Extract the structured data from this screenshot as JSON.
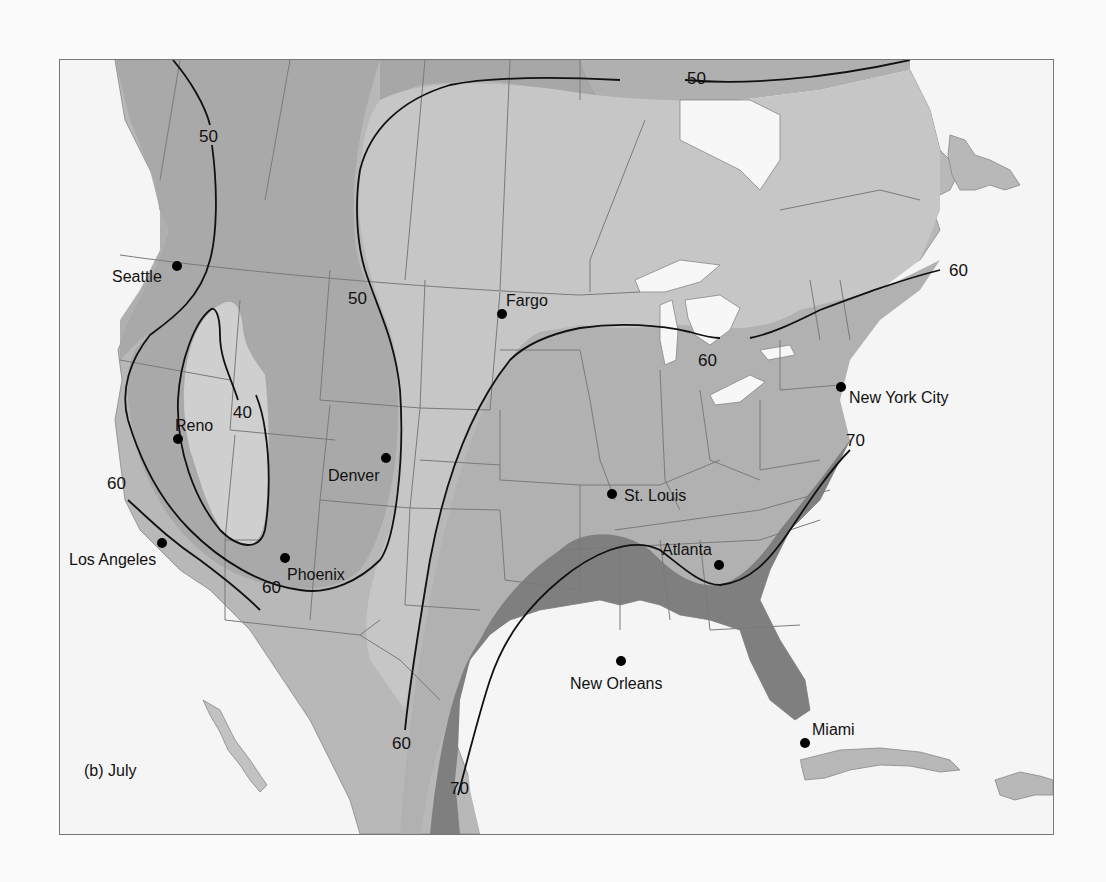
{
  "panel_label": "(b) July",
  "colors": {
    "ocean": "#f5f5f5",
    "lake": "#f7f7f7",
    "band_lt40": "#cdcdcd",
    "band_40_50": "#a9a9a9",
    "band_50_60": "#c6c6c6",
    "band_60_70": "#b3b3b3",
    "band_gt70": "#7f7f7f",
    "north_gt50": "#a3a3a3",
    "isoline": "#111111",
    "border": "#7a7a7a"
  },
  "isolines": [
    {
      "value": "50",
      "label_positions": [
        [
          148,
          75
        ],
        [
          297,
          237
        ],
        [
          626,
          17
        ]
      ]
    },
    {
      "value": "40",
      "label_positions": [
        [
          175,
          354
        ]
      ]
    },
    {
      "value": "60",
      "label_positions": [
        [
          47,
          425
        ],
        [
          201,
          528
        ],
        [
          330,
          684
        ],
        [
          637,
          300
        ],
        [
          888,
          212
        ]
      ]
    },
    {
      "value": "70",
      "label_positions": [
        [
          388,
          728
        ],
        [
          787,
          382
        ]
      ]
    }
  ],
  "cities": [
    {
      "name": "Seattle",
      "x": 117,
      "y": 206,
      "lx": 52,
      "ly": 222
    },
    {
      "name": "Fargo",
      "x": 442,
      "y": 254,
      "lx": 446,
      "ly": 246
    },
    {
      "name": "Reno",
      "x": 118,
      "y": 379,
      "lx": 115,
      "ly": 371
    },
    {
      "name": "Denver",
      "x": 326,
      "y": 398,
      "lx": 268,
      "ly": 421
    },
    {
      "name": "New York City",
      "x": 781,
      "y": 327,
      "lx": 789,
      "ly": 343
    },
    {
      "name": "St. Louis",
      "x": 552,
      "y": 434,
      "lx": 564,
      "ly": 441
    },
    {
      "name": "Los Angeles",
      "x": 102,
      "y": 483,
      "lx": 9,
      "ly": 505
    },
    {
      "name": "Phoenix",
      "x": 225,
      "y": 498,
      "lx": 227,
      "ly": 520
    },
    {
      "name": "Atlanta",
      "x": 659,
      "y": 505,
      "lx": 602,
      "ly": 495
    },
    {
      "name": "New Orleans",
      "x": 561,
      "y": 601,
      "lx": 510,
      "ly": 629
    },
    {
      "name": "Miami",
      "x": 745,
      "y": 683,
      "lx": 752,
      "ly": 675
    }
  ]
}
